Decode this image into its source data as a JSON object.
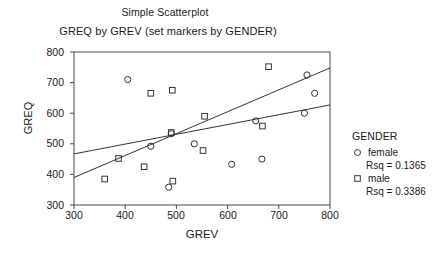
{
  "chart_data": {
    "type": "scatter",
    "title": "Simple Scatterplot",
    "subtitle": "GREQ by GREV (set markers by GENDER)",
    "xlabel": "GREV",
    "ylabel": "GREQ",
    "xlim": [
      300,
      800
    ],
    "ylim": [
      300,
      800
    ],
    "xticks": [
      300,
      400,
      500,
      600,
      700,
      800
    ],
    "yticks": [
      300,
      400,
      500,
      600,
      700,
      800
    ],
    "grid": false,
    "legend_position": "right",
    "legend_title": "GENDER",
    "series": [
      {
        "name": "female",
        "marker": "circle",
        "rsq_label": "Rsq = 0.1365",
        "rsq": 0.1365,
        "color": "#333333",
        "points": [
          {
            "x": 405,
            "y": 710
          },
          {
            "x": 450,
            "y": 492
          },
          {
            "x": 485,
            "y": 358
          },
          {
            "x": 490,
            "y": 533
          },
          {
            "x": 535,
            "y": 500
          },
          {
            "x": 608,
            "y": 433
          },
          {
            "x": 655,
            "y": 575
          },
          {
            "x": 667,
            "y": 450
          },
          {
            "x": 750,
            "y": 600
          },
          {
            "x": 755,
            "y": 725
          },
          {
            "x": 770,
            "y": 665
          }
        ],
        "fit_line": {
          "x0": 300,
          "y0": 467,
          "x1": 800,
          "y1": 627
        }
      },
      {
        "name": "male",
        "marker": "square",
        "rsq_label": "Rsq = 0.3386",
        "rsq": 0.3386,
        "color": "#333333",
        "points": [
          {
            "x": 360,
            "y": 385
          },
          {
            "x": 387,
            "y": 452
          },
          {
            "x": 437,
            "y": 425
          },
          {
            "x": 450,
            "y": 665
          },
          {
            "x": 490,
            "y": 537
          },
          {
            "x": 492,
            "y": 675
          },
          {
            "x": 493,
            "y": 378
          },
          {
            "x": 555,
            "y": 590
          },
          {
            "x": 552,
            "y": 478
          },
          {
            "x": 668,
            "y": 558
          },
          {
            "x": 680,
            "y": 752
          }
        ],
        "fit_line": {
          "x0": 300,
          "y0": 390,
          "x1": 800,
          "y1": 748
        }
      }
    ]
  },
  "titles": {
    "main": "Simple Scatterplot",
    "sub": "GREQ by GREV (set markers by GENDER)"
  },
  "axes": {
    "y_label": "GREQ",
    "x_label": "GREV",
    "y_ticks": [
      "800",
      "700",
      "600",
      "500",
      "400",
      "300"
    ],
    "x_ticks": [
      "300",
      "400",
      "500",
      "600",
      "700",
      "800"
    ]
  },
  "legend": {
    "title": "GENDER",
    "entries": [
      {
        "label": "female",
        "rsq": "Rsq = 0.1365",
        "marker": "circle-marker"
      },
      {
        "label": "male",
        "rsq": "Rsq = 0.3386",
        "marker": "square-marker"
      }
    ]
  },
  "colors": {
    "axis": "#4a4a4a",
    "marker": "#333333",
    "line": "#333333",
    "text": "#1a1a1a",
    "background": "#ffffff"
  }
}
